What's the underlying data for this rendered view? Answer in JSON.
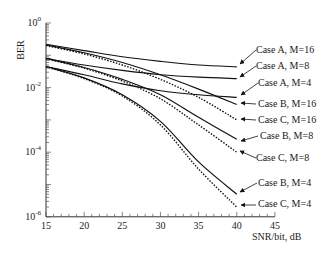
{
  "chart_data": {
    "type": "line",
    "title": "",
    "xlabel": "SNR/bit, dB",
    "ylabel": "BER",
    "xlim": [
      15,
      45
    ],
    "ylim": [
      1e-06,
      1
    ],
    "yscale": "log",
    "x_ticks": [
      15,
      20,
      25,
      30,
      35,
      40,
      45
    ],
    "y_ticks": [
      "10^0",
      "10^-2",
      "10^-4",
      "10^-6"
    ],
    "grid": false,
    "legend_position": "annotations on right with arrows",
    "x": [
      15,
      20,
      25,
      30,
      35,
      40
    ],
    "series": [
      {
        "name": "Case A, M=16",
        "style": "solid",
        "values": [
          0.22,
          0.14,
          0.09,
          0.065,
          0.05,
          0.044
        ]
      },
      {
        "name": "Case A, M=8",
        "style": "solid",
        "values": [
          0.08,
          0.05,
          0.034,
          0.025,
          0.021,
          0.019
        ]
      },
      {
        "name": "Case A, M=4",
        "style": "solid",
        "values": [
          0.045,
          0.025,
          0.013,
          0.008,
          0.006,
          0.005
        ]
      },
      {
        "name": "Case B, M=16",
        "style": "solid",
        "values": [
          0.21,
          0.12,
          0.06,
          0.025,
          0.009,
          0.003
        ]
      },
      {
        "name": "Case C, M=16",
        "style": "dotted",
        "values": [
          0.2,
          0.11,
          0.05,
          0.018,
          0.005,
          0.001
        ]
      },
      {
        "name": "Case B, M=8",
        "style": "solid",
        "values": [
          0.08,
          0.042,
          0.018,
          0.006,
          0.0012,
          0.00025
        ]
      },
      {
        "name": "Case C, M=8",
        "style": "dotted",
        "values": [
          0.078,
          0.04,
          0.016,
          0.0045,
          0.0007,
          0.0001
        ]
      },
      {
        "name": "Case B, M=4",
        "style": "solid",
        "values": [
          0.045,
          0.02,
          0.006,
          0.0009,
          5e-05,
          5e-06
        ]
      },
      {
        "name": "Case C, M=4",
        "style": "dotted",
        "values": [
          0.044,
          0.019,
          0.0055,
          0.0007,
          3e-05,
          2e-06
        ]
      }
    ],
    "annotations": [
      {
        "text": "Case A, M=16",
        "target": "Case A, M=16"
      },
      {
        "text": "Case A, M=8",
        "target": "Case A, M=8"
      },
      {
        "text": "Case A, M=4",
        "target": "Case A, M=4"
      },
      {
        "text": "Case B, M=16",
        "target": "Case B, M=16"
      },
      {
        "text": "Case C, M=16",
        "target": "Case C, M=16"
      },
      {
        "text": "Case B, M=8",
        "target": "Case B, M=8"
      },
      {
        "text": "Case C, M=8",
        "target": "Case C, M=8"
      },
      {
        "text": "Case B, M=4",
        "target": "Case B, M=4"
      },
      {
        "text": "Case C, M=4",
        "target": "Case C, M=4"
      }
    ]
  },
  "axes": {
    "xlabel": "SNR/bit, dB",
    "ylabel": "BER",
    "x_tick_labels": [
      "15",
      "20",
      "25",
      "30",
      "35",
      "40",
      "45"
    ],
    "y_tick_exps": [
      "0",
      "-2",
      "-4",
      "-6"
    ]
  },
  "labels": [
    "Case A, M=16",
    "Case A, M=8",
    "Case A, M=4",
    "Case B, M=16",
    "Case C, M=16",
    "Case B, M=8",
    "Case C, M=8",
    "Case B, M=4",
    "Case C, M=4"
  ]
}
